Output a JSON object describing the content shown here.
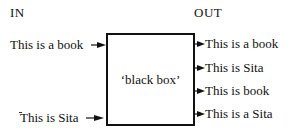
{
  "diagram": {
    "in_header": "IN",
    "out_header": "OUT",
    "box_label": "‘black box’",
    "inputs": [
      {
        "label": "This is a book"
      },
      {
        "label": "This is Sita"
      }
    ],
    "outputs": [
      {
        "label": "This is a book"
      },
      {
        "label": "This is Sita"
      },
      {
        "label": "This is book"
      },
      {
        "label": "This is a Sita"
      }
    ],
    "colors": {
      "line": "#111111",
      "background": "#ffffff"
    }
  }
}
